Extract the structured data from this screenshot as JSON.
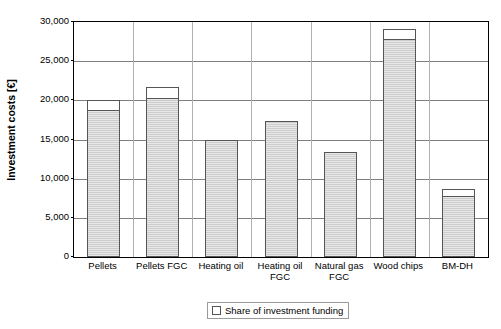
{
  "chart_data": {
    "type": "bar",
    "title": "",
    "subtitle": "",
    "xlabel": "",
    "ylabel": "Investment costs [€]",
    "ylim": [
      0,
      30000
    ],
    "ytick_values": [
      0,
      5000,
      10000,
      15000,
      20000,
      25000,
      30000
    ],
    "ytick_labels": [
      "0",
      "5,000",
      "10,000",
      "15,000",
      "20,000",
      "25,000",
      "30,000"
    ],
    "grid": "horizontal",
    "stacked": true,
    "legend_position": "bottom-center",
    "legend": [
      "Share of investment funding"
    ],
    "categories": [
      "Pellets",
      "Pellets FGC",
      "Heating oil",
      "Heating oil FGC",
      "Natural gas FGC",
      "Wood chips",
      "BM-DH"
    ],
    "category_lines": [
      [
        "Pellets"
      ],
      [
        "Pellets FGC"
      ],
      [
        "Heating oil"
      ],
      [
        "Heating oil",
        "FGC"
      ],
      [
        "Natural gas",
        "FGC"
      ],
      [
        "Wood chips"
      ],
      [
        "BM-DH"
      ]
    ],
    "series": [
      {
        "name": "Own investment",
        "values": [
          18800,
          20300,
          15000,
          17300,
          13400,
          27800,
          7800
        ]
      },
      {
        "name": "Share of investment funding",
        "values": [
          1300,
          1400,
          0,
          0,
          0,
          1300,
          900
        ]
      }
    ],
    "totals": [
      20100,
      21700,
      15000,
      17300,
      13400,
      29100,
      8700
    ],
    "colors": {
      "bar_fill": "#cccccc",
      "bar_border": "#555555",
      "funding_fill": "#ffffff",
      "gridline": "#808080",
      "axis": "#000000",
      "text": "#000000"
    }
  }
}
